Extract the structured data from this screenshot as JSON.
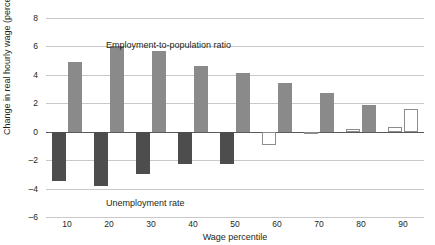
{
  "chart_data": {
    "type": "bar",
    "title": "",
    "xlabel": "Wage percentile",
    "ylabel": "Change in real hourly wage (percent)",
    "categories": [
      "10",
      "20",
      "30",
      "40",
      "50",
      "60",
      "70",
      "80",
      "90"
    ],
    "xticks": [
      "10",
      "20",
      "30",
      "40",
      "50",
      "60",
      "70",
      "80",
      "90"
    ],
    "yticks": [
      "8",
      "6",
      "4",
      "2",
      "0",
      "–2",
      "–4",
      "–6"
    ],
    "ytick_values": [
      8,
      6,
      4,
      2,
      0,
      -2,
      -4,
      -6
    ],
    "ylim": [
      -6,
      8
    ],
    "grid": true,
    "legend_position": "none",
    "annotations": [
      {
        "text": "Employment-to-population ratio",
        "near": "top-left"
      },
      {
        "text": "Unemployment rate",
        "near": "bottom-left"
      }
    ],
    "series": [
      {
        "name": "Unemployment rate",
        "values": [
          -3.5,
          -3.8,
          -3.0,
          -2.3,
          -2.3,
          -0.95,
          -0.15,
          0.2,
          0.3
        ],
        "fills": [
          "solid-dark",
          "solid-dark",
          "solid-dark",
          "solid-dark",
          "solid-dark",
          "hollow",
          "hollow",
          "hollow",
          "hollow"
        ]
      },
      {
        "name": "Employment-to-population ratio",
        "values": [
          4.9,
          6.0,
          5.65,
          4.65,
          4.15,
          3.4,
          2.75,
          1.85,
          1.6
        ],
        "fills": [
          "solid-gray",
          "solid-gray",
          "solid-gray",
          "solid-gray",
          "solid-gray",
          "solid-gray",
          "solid-gray",
          "solid-gray",
          "hollow"
        ]
      }
    ],
    "colors": {
      "unemployment_fill": "#4d4d4d",
      "employment_fill": "#8a8a8a",
      "hollow_stroke": "#8c8c8c",
      "gridline": "#c9c9c9",
      "zero_line": "#5a5a5a",
      "background": "#ffffff",
      "text": "#231f20"
    }
  }
}
